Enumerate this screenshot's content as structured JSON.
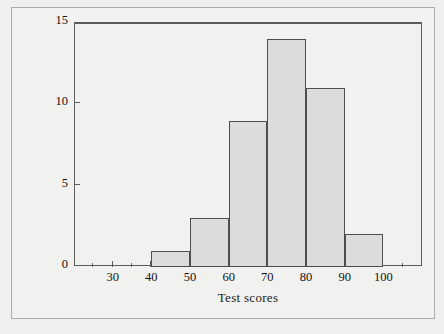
{
  "chart_data": {
    "type": "bar",
    "title": "",
    "subtitle": "",
    "xlabel": "Test scores",
    "ylabel": "Class frequencies",
    "grid": false,
    "legend": "none",
    "xlim": [
      20,
      110
    ],
    "ylim": [
      0,
      15
    ],
    "x_major_step": 10,
    "x_minor_step": 5,
    "y_major_step": 5,
    "bin_width": 10,
    "categories": [
      "40-50",
      "50-60",
      "60-70",
      "70-80",
      "80-90",
      "90-100"
    ],
    "bin_edges": [
      40,
      50,
      60,
      70,
      80,
      90,
      100
    ],
    "values": [
      1,
      3,
      9,
      14,
      11,
      2
    ],
    "xticks": [
      30,
      40,
      50,
      60,
      70,
      80,
      90,
      100
    ],
    "xtick_labels": [
      "30",
      "40",
      "50",
      "60",
      "70",
      "80",
      "90",
      "100"
    ],
    "x_minor_ticks": [
      25,
      35,
      45,
      55,
      65,
      75,
      85,
      95,
      105
    ],
    "yticks": [
      0,
      5,
      10,
      15
    ],
    "ytick_labels": [
      "0",
      "5",
      "10",
      "15"
    ],
    "colors": {
      "bar_fill": "#dcdcdc",
      "bar_border": "#4e4e4e",
      "axis": "#5d5d5d",
      "text": "#121212",
      "page_background": "#efefed",
      "frame_border": "#adadad"
    }
  }
}
